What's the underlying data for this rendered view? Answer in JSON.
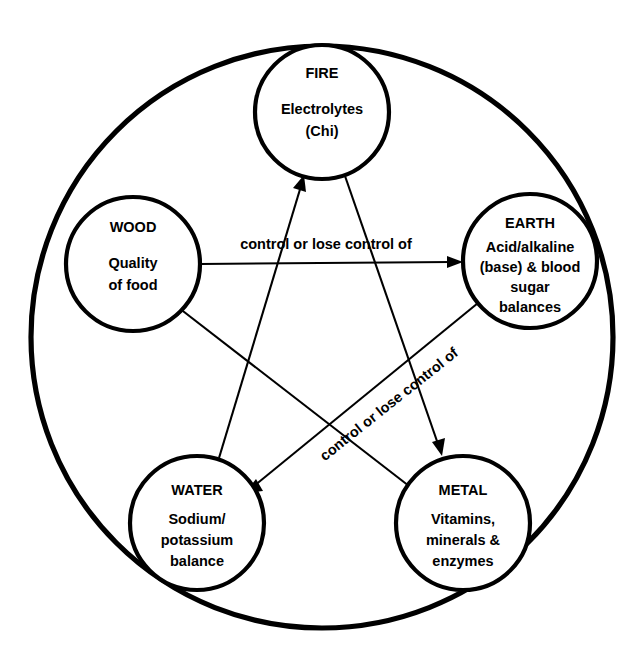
{
  "diagram": {
    "type": "five-element-control-cycle",
    "outer_ring": {
      "name": "outer-boundary-circle",
      "cx": 322,
      "cy": 337,
      "r": 291
    },
    "nodes": [
      {
        "id": "fire",
        "title": "FIRE",
        "lines": [
          "Electrolytes",
          "(Chi)"
        ],
        "cx": 322,
        "cy": 112,
        "r": 67
      },
      {
        "id": "wood",
        "title": "WOOD",
        "lines": [
          "Quality",
          "of food"
        ],
        "cx": 133,
        "cy": 264,
        "r": 67
      },
      {
        "id": "earth",
        "title": "EARTH",
        "lines": [
          "Acid/alkaline",
          "(base) & blood",
          "sugar",
          "balances"
        ],
        "cx": 530,
        "cy": 261,
        "r": 67
      },
      {
        "id": "water",
        "title": "WATER",
        "lines": [
          "Sodium/",
          "potassium",
          "balance"
        ],
        "cx": 197,
        "cy": 523,
        "r": 67
      },
      {
        "id": "metal",
        "title": "METAL",
        "lines": [
          "Vitamins,",
          "minerals &",
          "enzymes"
        ],
        "cx": 463,
        "cy": 523,
        "r": 67
      }
    ],
    "edges": [
      {
        "id": "wood-to-earth",
        "from": "wood",
        "to": "earth",
        "label": "control or lose control of"
      },
      {
        "id": "earth-to-water",
        "from": "earth",
        "to": "water",
        "label": "control or lose control of"
      },
      {
        "id": "water-to-fire",
        "from": "water",
        "to": "fire",
        "label": ""
      },
      {
        "id": "fire-to-metal",
        "from": "fire",
        "to": "metal",
        "label": ""
      },
      {
        "id": "metal-to-wood",
        "from": "metal",
        "to": "wood",
        "label": ""
      }
    ],
    "labels": {
      "horizontal_edge_label": "control or lose control of",
      "diagonal_edge_label": "control or lose control of"
    },
    "colors": {
      "stroke": "#000000",
      "background": "#ffffff",
      "text": "#000000"
    }
  }
}
